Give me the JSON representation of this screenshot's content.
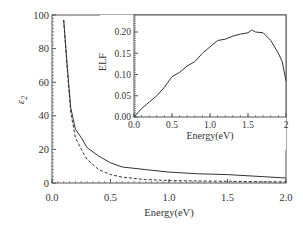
{
  "chart_data": [
    {
      "type": "line",
      "role": "main",
      "title": "",
      "xlabel": "Energy(eV)",
      "ylabel": "ε2",
      "xlim": [
        0,
        2.0
      ],
      "ylim": [
        0,
        100
      ],
      "xticks": [
        "0.0",
        "0.5",
        "1.0",
        "1.5",
        "2.0"
      ],
      "yticks": [
        "0",
        "20",
        "40",
        "60",
        "80",
        "100"
      ],
      "grid": false,
      "legend": null,
      "series": [
        {
          "name": "solid",
          "style": "solid",
          "x": [
            0.1,
            0.13,
            0.16,
            0.2,
            0.25,
            0.3,
            0.4,
            0.5,
            0.6,
            0.8,
            1.0,
            1.25,
            1.5,
            1.75,
            2.0
          ],
          "y": [
            97,
            70,
            45,
            32,
            27,
            21,
            16,
            12,
            9.5,
            8,
            6.5,
            5.5,
            5,
            4,
            3
          ]
        },
        {
          "name": "dashed",
          "style": "dashed",
          "x": [
            0.1,
            0.13,
            0.16,
            0.2,
            0.25,
            0.3,
            0.4,
            0.5,
            0.6,
            0.8,
            1.0,
            1.25,
            1.5,
            1.75,
            2.0
          ],
          "y": [
            97,
            68,
            42,
            27,
            20,
            14,
            8,
            5,
            3.5,
            2,
            1.5,
            1.2,
            1,
            0.8,
            0.6
          ]
        }
      ]
    },
    {
      "type": "line",
      "role": "inset",
      "title": "",
      "xlabel": "Energy(eV)",
      "ylabel": "ELF",
      "xlim": [
        0,
        2.0
      ],
      "ylim": [
        0,
        0.24
      ],
      "xticks": [
        "0.0",
        "0.5",
        "1.0",
        "1.5",
        "2"
      ],
      "yticks": [
        "0.00",
        "0.05",
        "0.10",
        "0.15",
        "0.20"
      ],
      "grid": false,
      "series": [
        {
          "name": "ELF",
          "style": "solid",
          "x": [
            0.0,
            0.1,
            0.2,
            0.3,
            0.4,
            0.5,
            0.6,
            0.7,
            0.8,
            0.9,
            1.0,
            1.1,
            1.2,
            1.3,
            1.4,
            1.5,
            1.55,
            1.6,
            1.7,
            1.8,
            1.9,
            1.95,
            2.0
          ],
          "y": [
            0.0,
            0.02,
            0.035,
            0.05,
            0.07,
            0.095,
            0.105,
            0.12,
            0.13,
            0.15,
            0.165,
            0.18,
            0.183,
            0.19,
            0.195,
            0.198,
            0.205,
            0.2,
            0.198,
            0.18,
            0.15,
            0.13,
            0.085
          ]
        }
      ]
    }
  ]
}
